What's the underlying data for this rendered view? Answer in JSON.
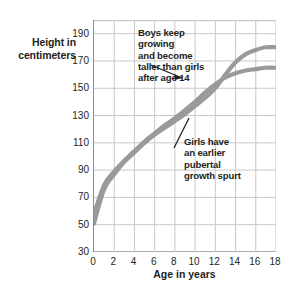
{
  "chart_data": {
    "type": "line",
    "title": "",
    "xlabel": "Age in years",
    "ylabel": "Height in centimeters",
    "xlim": [
      0,
      18
    ],
    "ylim": [
      30,
      200
    ],
    "grid": true,
    "legend_position": "none",
    "x_ticks": [
      "0",
      "2",
      "4",
      "6",
      "8",
      "10",
      "12",
      "14",
      "16",
      "18"
    ],
    "y_ticks": [
      "30",
      "50",
      "70",
      "90",
      "110",
      "130",
      "150",
      "170",
      "190"
    ],
    "x": [
      0,
      1,
      2,
      3,
      4,
      5,
      6,
      7,
      8,
      9,
      10,
      11,
      12,
      13,
      14,
      15,
      16,
      17,
      18
    ],
    "series": [
      {
        "name": "Boys",
        "color": "#9a9a9a",
        "values": [
          51,
          76,
          87,
          96,
          103,
          110,
          116,
          121,
          126,
          131,
          137,
          143,
          150,
          160,
          169,
          175,
          178,
          180,
          180
        ]
      },
      {
        "name": "Girls",
        "color": "#9a9a9a",
        "values": [
          58,
          79,
          89,
          97,
          104,
          111,
          117,
          123,
          128,
          134,
          140,
          147,
          153,
          158,
          161,
          163,
          164,
          165,
          165
        ]
      }
    ],
    "annotations": [
      {
        "name": "boys-annotation",
        "text": "Boys keep growing and become taller than girls after age 14",
        "target": "boys-curve-near-age-16"
      },
      {
        "name": "girls-annotation",
        "text": "Girls have an earlier pubertal growth spurt",
        "target": "curve-crossover-near-age-11"
      }
    ]
  },
  "axes": {
    "y_title_line1": "Height in",
    "y_title_line2": "centimeters",
    "x_title": "Age in years"
  },
  "annotations": {
    "boys": {
      "line1": "Boys keep growing",
      "line2": "and become",
      "line3": "taller than girls",
      "line4": "after age 14"
    },
    "girls": {
      "line1": "Girls have",
      "line2": "an earlier",
      "line3": "pubertal",
      "line4": "growth spurt"
    }
  },
  "colors": {
    "curve": "#9a9a9a",
    "grid": "#c8c8c8",
    "axis": "#8e8e8e",
    "text": "#231f20"
  }
}
